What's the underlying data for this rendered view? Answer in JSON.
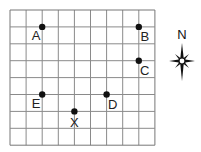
{
  "grid": {
    "columns": 9,
    "rows": 8,
    "origin_x": 10,
    "origin_y": 10,
    "cell_w": 16.1,
    "cell_h": 16.9,
    "line_color": "#8a8a8a",
    "border_color": "#777777"
  },
  "points": [
    {
      "label": "A",
      "col": 2,
      "row": 1,
      "label_pos": "lower-left"
    },
    {
      "label": "B",
      "col": 8,
      "row": 1,
      "label_pos": "lower-right"
    },
    {
      "label": "C",
      "col": 8,
      "row": 3,
      "label_pos": "lower-right"
    },
    {
      "label": "D",
      "col": 6,
      "row": 5,
      "label_pos": "lower-right"
    },
    {
      "label": "E",
      "col": 2,
      "row": 5,
      "label_pos": "lower-left"
    },
    {
      "label": "X",
      "col": 4,
      "row": 6,
      "label_pos": "below"
    }
  ],
  "compass": {
    "label": "N",
    "center_x": 182,
    "center_y": 61,
    "icon": "compass-rose-icon"
  },
  "colors": {
    "point": "#111111",
    "text": "#222222"
  }
}
